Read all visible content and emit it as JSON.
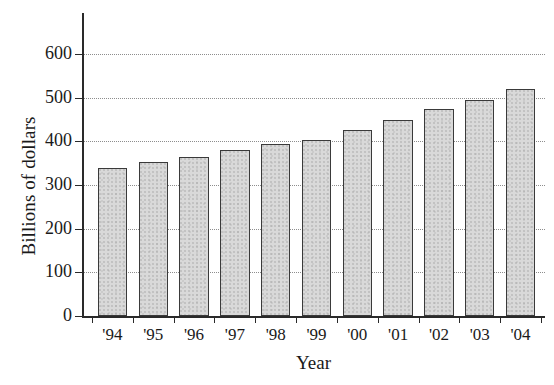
{
  "chart_data": {
    "type": "bar",
    "title": "",
    "xlabel": "Year",
    "ylabel": "Billions of dollars",
    "categories": [
      "'94",
      "'95",
      "'96",
      "'97",
      "'98",
      "'99",
      "'00",
      "'01",
      "'02",
      "'03",
      "'04"
    ],
    "values": [
      340,
      352,
      365,
      380,
      394,
      403,
      425,
      450,
      475,
      495,
      520
    ],
    "ylim": [
      0,
      650
    ],
    "yticks": [
      0,
      100,
      200,
      300,
      400,
      500,
      600
    ],
    "ytick_labels": [
      "0",
      "100",
      "200",
      "300",
      "400",
      "500",
      "600"
    ],
    "grid": true,
    "grid_style": "dotted",
    "legend": "none",
    "bar_fill_color": "#d9d9d9",
    "bar_edge_color": "#3a3a3a",
    "axis_color": "#2a2a2a",
    "grid_color": "#8d8d8d",
    "background_color": "#ffffff"
  }
}
